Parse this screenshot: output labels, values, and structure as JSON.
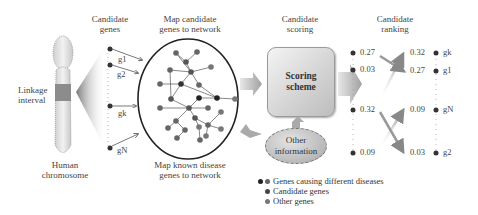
{
  "headers": {
    "candidate_genes": [
      "Candidate",
      "genes"
    ],
    "map_candidate": [
      "Map candidate",
      "genes to network"
    ],
    "candidate_scoring": [
      "Candidate",
      "scoring"
    ],
    "candidate_ranking": [
      "Candidate",
      "ranking"
    ]
  },
  "chromosome": {
    "linkage_label": [
      "Linkage",
      "interval"
    ],
    "caption": [
      "Human",
      "chromosome"
    ]
  },
  "candidate_genes": [
    "g1",
    "g2",
    "gk",
    "gN"
  ],
  "network": {
    "caption": [
      "Map known disease",
      "genes to network"
    ]
  },
  "scoring_box": {
    "label": [
      "Scoring",
      "scheme"
    ]
  },
  "other_info": {
    "label": [
      "Other",
      "information"
    ]
  },
  "scores_before": [
    "0.27",
    "0.03",
    "0.32",
    "0.09"
  ],
  "ranking": [
    {
      "score": "0.32",
      "gene": "gk"
    },
    {
      "score": "0.27",
      "gene": "g1"
    },
    {
      "score": "0.09",
      "gene": "gN"
    },
    {
      "score": "0.03",
      "gene": "g2"
    }
  ],
  "legend": [
    {
      "label": "Genes causing different diseases",
      "colors": [
        "#222222",
        "#666666"
      ]
    },
    {
      "label": "Candidate genes",
      "colors": [
        "#444444"
      ]
    },
    {
      "label": "Other genes",
      "colors": [
        "#777777"
      ]
    }
  ],
  "colors": {
    "node_dark": "#222222",
    "node_mid": "#555555",
    "node_light": "#777777",
    "chromosome_fill": "#e6e6e6",
    "linkage_fill": "#8a8a8a",
    "arrow_gray": "#b0b0b0"
  }
}
